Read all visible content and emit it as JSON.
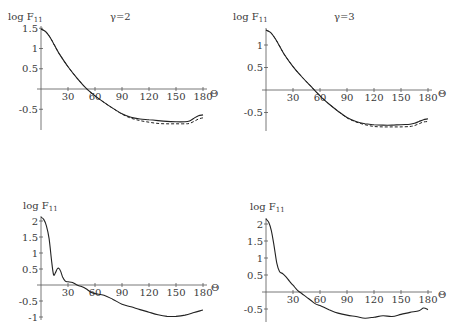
{
  "chart_data": [
    {
      "type": "line",
      "title": "γ=2",
      "ylabel": "log F11",
      "xlabel": "Θ",
      "xticks": [
        30,
        60,
        90,
        120,
        150,
        180
      ],
      "yticks": [
        1.5,
        1,
        0.5,
        -0.5
      ],
      "xlim": [
        0,
        180
      ],
      "ylim": [
        -1.0,
        1.5
      ],
      "series": [
        {
          "name": "solid",
          "style": "solid",
          "x": [
            0,
            5,
            10,
            15,
            20,
            30,
            40,
            50,
            60,
            70,
            80,
            90,
            100,
            110,
            120,
            130,
            140,
            150,
            160,
            165,
            170,
            175,
            180
          ],
          "y": [
            1.48,
            1.42,
            1.28,
            1.08,
            0.88,
            0.55,
            0.27,
            0.02,
            -0.17,
            -0.33,
            -0.48,
            -0.61,
            -0.7,
            -0.74,
            -0.76,
            -0.78,
            -0.8,
            -0.81,
            -0.81,
            -0.79,
            -0.72,
            -0.66,
            -0.64
          ]
        },
        {
          "name": "dashed",
          "style": "dashed",
          "x": [
            0,
            5,
            10,
            15,
            20,
            30,
            40,
            50,
            60,
            70,
            80,
            90,
            100,
            110,
            120,
            130,
            140,
            150,
            160,
            165,
            170,
            175,
            180
          ],
          "y": [
            1.48,
            1.42,
            1.28,
            1.08,
            0.88,
            0.55,
            0.27,
            0.02,
            -0.17,
            -0.33,
            -0.48,
            -0.62,
            -0.72,
            -0.78,
            -0.82,
            -0.85,
            -0.86,
            -0.86,
            -0.86,
            -0.85,
            -0.8,
            -0.74,
            -0.71
          ]
        }
      ]
    },
    {
      "type": "line",
      "title": "γ=3",
      "ylabel": "log F11",
      "xlabel": "Θ",
      "xticks": [
        30,
        60,
        90,
        120,
        150,
        180
      ],
      "yticks": [
        1,
        0.5,
        -0.5
      ],
      "xlim": [
        0,
        180
      ],
      "ylim": [
        -0.9,
        1.35
      ],
      "series": [
        {
          "name": "solid",
          "style": "solid",
          "x": [
            0,
            5,
            10,
            15,
            20,
            30,
            40,
            50,
            60,
            70,
            80,
            90,
            100,
            110,
            120,
            130,
            140,
            150,
            160,
            165,
            170,
            175,
            180
          ],
          "y": [
            1.33,
            1.28,
            1.15,
            0.98,
            0.8,
            0.52,
            0.29,
            0.08,
            -0.13,
            -0.31,
            -0.47,
            -0.61,
            -0.7,
            -0.75,
            -0.77,
            -0.78,
            -0.78,
            -0.77,
            -0.76,
            -0.74,
            -0.7,
            -0.66,
            -0.64
          ]
        },
        {
          "name": "dashed",
          "style": "dashed",
          "x": [
            0,
            5,
            10,
            15,
            20,
            30,
            40,
            50,
            60,
            70,
            80,
            90,
            100,
            110,
            120,
            130,
            140,
            150,
            160,
            165,
            170,
            175,
            180
          ],
          "y": [
            1.33,
            1.28,
            1.15,
            0.98,
            0.8,
            0.52,
            0.29,
            0.08,
            -0.13,
            -0.31,
            -0.47,
            -0.62,
            -0.71,
            -0.77,
            -0.81,
            -0.82,
            -0.82,
            -0.82,
            -0.81,
            -0.79,
            -0.75,
            -0.71,
            -0.7
          ]
        }
      ]
    },
    {
      "type": "line",
      "title": "",
      "ylabel": "log F11",
      "xlabel": "Θ",
      "xticks": [
        30,
        60,
        90,
        120,
        150,
        180
      ],
      "yticks": [
        2,
        1.5,
        1,
        0.5,
        -0.5,
        -1
      ],
      "xlim": [
        0,
        180
      ],
      "ylim": [
        -1.0,
        2.15
      ],
      "series": [
        {
          "name": "solid",
          "style": "solid",
          "x": [
            0,
            3,
            6,
            9,
            12,
            14,
            16,
            18,
            20,
            22,
            24,
            27,
            30,
            35,
            40,
            45,
            50,
            55,
            60,
            70,
            80,
            90,
            100,
            110,
            120,
            130,
            140,
            150,
            160,
            170,
            180
          ],
          "y": [
            2.12,
            2.05,
            1.85,
            1.45,
            0.7,
            0.32,
            0.38,
            0.5,
            0.52,
            0.42,
            0.25,
            0.12,
            0.1,
            0.08,
            0.0,
            -0.05,
            -0.12,
            -0.22,
            -0.27,
            -0.32,
            -0.45,
            -0.6,
            -0.68,
            -0.77,
            -0.85,
            -0.93,
            -0.98,
            -0.98,
            -0.94,
            -0.86,
            -0.78
          ]
        }
      ]
    },
    {
      "type": "line",
      "title": "",
      "ylabel": "log F11",
      "xlabel": "Θ",
      "xticks": [
        30,
        60,
        90,
        120,
        150,
        180
      ],
      "yticks": [
        2,
        1.5,
        1,
        0.5,
        -0.5
      ],
      "xlim": [
        0,
        180
      ],
      "ylim": [
        -0.85,
        2.15
      ],
      "series": [
        {
          "name": "solid",
          "style": "solid",
          "x": [
            0,
            3,
            6,
            9,
            12,
            15,
            18,
            22,
            26,
            30,
            35,
            40,
            45,
            50,
            55,
            60,
            70,
            80,
            90,
            100,
            110,
            120,
            130,
            140,
            150,
            160,
            170,
            175,
            180
          ],
          "y": [
            2.15,
            2.05,
            1.8,
            1.35,
            0.85,
            0.6,
            0.55,
            0.45,
            0.32,
            0.2,
            0.05,
            -0.05,
            -0.15,
            -0.25,
            -0.35,
            -0.4,
            -0.52,
            -0.62,
            -0.68,
            -0.72,
            -0.77,
            -0.74,
            -0.7,
            -0.72,
            -0.66,
            -0.6,
            -0.55,
            -0.47,
            -0.52
          ]
        }
      ]
    }
  ],
  "panels": [
    {
      "ylabel_main": "log F",
      "ylabel_sub": "11",
      "title": "γ=2",
      "xlabel": "Θ"
    },
    {
      "ylabel_main": "log F",
      "ylabel_sub": "11",
      "title": "γ=3",
      "xlabel": "Θ"
    },
    {
      "ylabel_main": "log F",
      "ylabel_sub": "11",
      "title": "",
      "xlabel": "Θ"
    },
    {
      "ylabel_main": "log F",
      "ylabel_sub": "11",
      "title": "",
      "xlabel": "Θ"
    }
  ]
}
